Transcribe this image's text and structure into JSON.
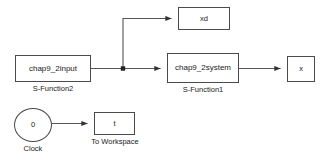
{
  "diagram": {
    "background_color": "#ffffff",
    "wire_color": "#555555",
    "block_border_color": "#4a4a4a",
    "text_color": "#1a1a1a"
  },
  "blocks": {
    "s_function2": {
      "label": "chap9_2input",
      "caption": "S-Function2"
    },
    "s_function1": {
      "label": "chap9_2system",
      "caption": "S-Function1"
    },
    "xd_scope": {
      "label": "xd"
    },
    "x_scope": {
      "label": "x"
    },
    "clock": {
      "label": "0",
      "caption": "Clock"
    },
    "to_workspace": {
      "label": "t",
      "caption": "To Workspace"
    }
  },
  "connections": [
    {
      "name": "input-to-junction",
      "from": "s_function2",
      "to": "junction"
    },
    {
      "name": "junction-to-xd",
      "from": "junction",
      "to": "xd_scope"
    },
    {
      "name": "junction-to-system",
      "from": "junction",
      "to": "s_function1"
    },
    {
      "name": "system-to-x",
      "from": "s_function1",
      "to": "x_scope"
    },
    {
      "name": "clock-to-workspace",
      "from": "clock",
      "to": "to_workspace"
    }
  ]
}
